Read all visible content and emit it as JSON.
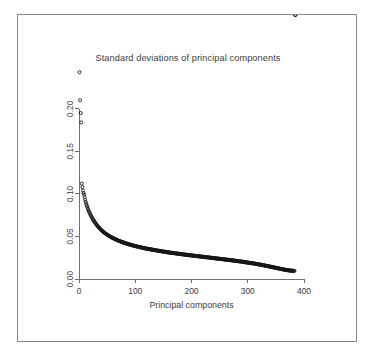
{
  "chart_data": {
    "type": "scatter",
    "title": "Standard deviations of principal components",
    "xlabel": "Principal components",
    "ylabel": "",
    "xlim": [
      0,
      400
    ],
    "ylim": [
      0.0,
      0.235
    ],
    "grid": false,
    "legend": null,
    "marker": "open-circle",
    "marker_color": "#141414",
    "xticks": [
      0,
      100,
      200,
      300,
      400
    ],
    "xticklabels": [
      "0",
      "100",
      "200",
      "300",
      "400"
    ],
    "yticks": [
      0.0,
      0.05,
      0.1,
      0.15,
      0.2
    ],
    "yticklabels": [
      "0.00",
      "0.05",
      "0.10",
      "0.15",
      "0.20"
    ],
    "x": [
      1,
      2,
      3,
      4,
      5,
      6,
      7,
      8,
      9,
      10,
      11,
      12,
      13,
      14,
      15,
      16,
      17,
      18,
      19,
      20,
      21,
      22,
      23,
      24,
      25,
      26,
      27,
      28,
      29,
      30,
      31,
      32,
      33,
      34,
      35,
      36,
      37,
      38,
      39,
      40,
      42,
      44,
      46,
      48,
      50,
      52,
      54,
      56,
      58,
      60,
      63,
      66,
      69,
      72,
      75,
      78,
      81,
      84,
      87,
      90,
      95,
      100,
      105,
      110,
      115,
      120,
      125,
      130,
      135,
      140,
      145,
      150,
      155,
      160,
      165,
      170,
      175,
      180,
      185,
      190,
      195,
      200,
      205,
      210,
      215,
      220,
      225,
      230,
      235,
      240,
      245,
      250,
      255,
      260,
      265,
      270,
      275,
      280,
      285,
      290,
      295,
      300,
      305,
      310,
      315,
      320,
      325,
      330,
      335,
      340,
      345,
      350,
      355,
      360,
      365,
      370,
      375,
      378,
      381,
      383,
      385
    ],
    "y": [
      0.243,
      0.21,
      0.195,
      0.184,
      0.112,
      0.108,
      0.104,
      0.101,
      0.099,
      0.096,
      0.093,
      0.0905,
      0.088,
      0.086,
      0.084,
      0.0822,
      0.0805,
      0.079,
      0.0776,
      0.0762,
      0.0748,
      0.0735,
      0.0722,
      0.071,
      0.0699,
      0.0688,
      0.0678,
      0.0668,
      0.0658,
      0.0649,
      0.064,
      0.0631,
      0.0623,
      0.0615,
      0.0607,
      0.06,
      0.0593,
      0.0586,
      0.0579,
      0.0573,
      0.0561,
      0.055,
      0.054,
      0.053,
      0.0521,
      0.0512,
      0.0504,
      0.0496,
      0.0489,
      0.0482,
      0.0472,
      0.0463,
      0.0454,
      0.0446,
      0.0438,
      0.0431,
      0.0424,
      0.0417,
      0.0411,
      0.0405,
      0.0396,
      0.0387,
      0.0379,
      0.0371,
      0.0364,
      0.0357,
      0.0351,
      0.0345,
      0.0339,
      0.0333,
      0.0328,
      0.0322,
      0.0317,
      0.0312,
      0.0307,
      0.0303,
      0.0298,
      0.0294,
      0.0289,
      0.0285,
      0.0281,
      0.0277,
      0.0273,
      0.0269,
      0.0265,
      0.0261,
      0.0257,
      0.0253,
      0.0249,
      0.0245,
      0.0241,
      0.0237,
      0.0233,
      0.0229,
      0.0225,
      0.0221,
      0.0217,
      0.0212,
      0.0208,
      0.0203,
      0.0198,
      0.0193,
      0.0188,
      0.0183,
      0.0177,
      0.0171,
      0.0165,
      0.0159,
      0.0152,
      0.0145,
      0.0138,
      0.0131,
      0.0124,
      0.0117,
      0.011,
      0.0104,
      0.01,
      0.0097,
      0.0096,
      0.0095
    ]
  },
  "plot_geometry": {
    "box_left": 61,
    "box_right": 286,
    "box_top": 64,
    "box_bottom": 264
  }
}
